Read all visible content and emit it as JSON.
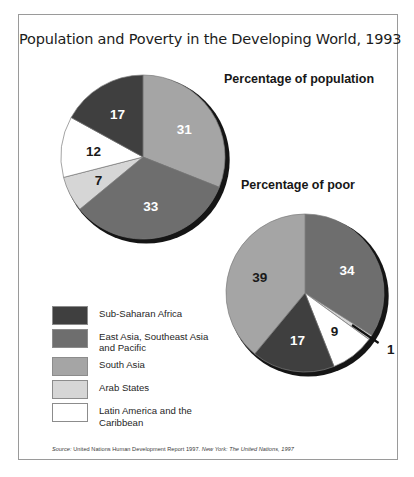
{
  "figure": {
    "title": "Population and Poverty in the Developing World, 1993",
    "source_prefix": "Source:",
    "source_text": " United Nations Human Development Report 1997. ",
    "source_italic_tail": "New York: The United Nations, 1997"
  },
  "headings": {
    "population": "Percentage of population",
    "poor": "Percentage of poor"
  },
  "legend": {
    "items": [
      {
        "label": "Sub-Saharan Africa",
        "color": "#3f3f3f"
      },
      {
        "label": "East Asia, Southeast Asia\nand Pacific",
        "color": "#6e6e6e"
      },
      {
        "label": "South Asia",
        "color": "#a5a5a5"
      },
      {
        "label": "Arab States",
        "color": "#d6d6d6"
      },
      {
        "label": "Latin America and the\nCaribbean",
        "color": "#ffffff"
      }
    ]
  },
  "chart_data": [
    {
      "type": "pie",
      "title": "Percentage of population",
      "categories": [
        "South Asia",
        "East Asia, Southeast Asia and Pacific",
        "Arab States",
        "Latin America and the Caribbean",
        "Sub-Saharan Africa"
      ],
      "values": [
        31,
        33,
        7,
        12,
        17
      ],
      "colors": [
        "#a5a5a5",
        "#6e6e6e",
        "#d6d6d6",
        "#ffffff",
        "#3f3f3f"
      ],
      "labels": [
        "31",
        "33",
        "7",
        "12",
        "17"
      ],
      "label_colors": [
        "#ffffff",
        "#ffffff",
        "#1a1a1a",
        "#1a1a1a",
        "#ffffff"
      ],
      "units": "percent",
      "legend_position": "bottom-left",
      "start_angle_deg": 0
    },
    {
      "type": "pie",
      "title": "Percentage of poor",
      "categories": [
        "East Asia, Southeast Asia and Pacific",
        "Arab States",
        "Latin America and the Caribbean",
        "Sub-Saharan Africa",
        "South Asia"
      ],
      "values": [
        34,
        1,
        9,
        17,
        39
      ],
      "colors": [
        "#6e6e6e",
        "#d6d6d6",
        "#ffffff",
        "#3f3f3f",
        "#a5a5a5"
      ],
      "labels": [
        "34",
        "1",
        "9",
        "17",
        "39"
      ],
      "label_colors": [
        "#ffffff",
        "#1a1a1a",
        "#1a1a1a",
        "#ffffff",
        "#1a1a1a"
      ],
      "units": "percent",
      "legend_position": "bottom-left",
      "start_angle_deg": 0
    }
  ]
}
